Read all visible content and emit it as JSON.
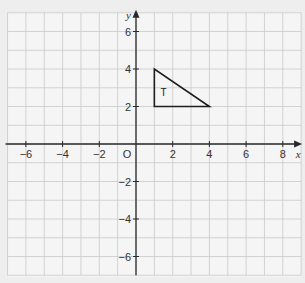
{
  "chart_data": {
    "type": "scatter",
    "title": "",
    "xlabel": "x",
    "ylabel": "y",
    "xlim": [
      -7,
      9
    ],
    "ylim": [
      -7,
      7
    ],
    "grid": true,
    "origin_label": "O",
    "x_ticks": [
      -6,
      -4,
      -2,
      2,
      4,
      6,
      8
    ],
    "y_ticks": [
      6,
      4,
      2,
      -2,
      -4,
      -6
    ],
    "x_tick_labels": [
      "−6",
      "−4",
      "−2",
      "2",
      "4",
      "6",
      "8"
    ],
    "y_tick_labels": [
      "6",
      "4",
      "2",
      "−2",
      "−4",
      "−6"
    ],
    "shapes": [
      {
        "name": "T",
        "kind": "triangle",
        "vertices": [
          [
            1,
            4
          ],
          [
            1,
            2
          ],
          [
            4,
            2
          ]
        ],
        "label": "T",
        "label_at": [
          1.5,
          2.75
        ]
      }
    ]
  },
  "colors": {
    "background": "#eeeeee",
    "grid": "#c9c9c9",
    "axis": "#2a2a2a",
    "shape": "#1e1e1e"
  }
}
